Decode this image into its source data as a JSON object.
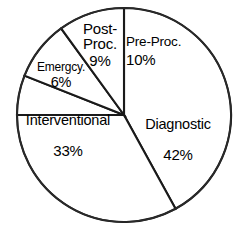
{
  "chart_data": {
    "type": "pie",
    "title": "",
    "subtitle": "",
    "xlabel": "",
    "ylabel": "",
    "legend_position": "none",
    "grid": false,
    "labels_inside_slices": true,
    "start_angle_deg": 0,
    "direction": "clockwise",
    "categories": [
      "Diagnostic",
      "Interventional",
      "Pre-Proc.",
      "Post-Proc.",
      "Emergcy."
    ],
    "values": [
      42,
      33,
      10,
      9,
      6
    ],
    "units": "percent",
    "slices": [
      {
        "name": "Diagnostic",
        "label": "Diagnostic",
        "value": 42,
        "value_label": "42%",
        "start_deg": 0,
        "end_deg": 151.2,
        "color": "#ffffff"
      },
      {
        "name": "Interventional",
        "label": "Interventional",
        "value": 33,
        "value_label": "33%",
        "start_deg": 151.2,
        "end_deg": 270.0,
        "color": "#ffffff"
      },
      {
        "name": "Emergency",
        "label": "Emergcy.",
        "value": 6,
        "value_label": "6%",
        "start_deg": 270.0,
        "end_deg": 291.6,
        "color": "#ffffff"
      },
      {
        "name": "Post-Procedural",
        "label_line1": "Post-",
        "label_line2": "Proc.",
        "label": "Post-Proc.",
        "value": 9,
        "value_label": "9%",
        "start_deg": 291.6,
        "end_deg": 324.0,
        "color": "#ffffff"
      },
      {
        "name": "Pre-Procedural",
        "label": "Pre-Proc.",
        "value": 10,
        "value_label": "10%",
        "start_deg": 324.0,
        "end_deg": 360.0,
        "color": "#ffffff"
      }
    ],
    "geometry": {
      "center_x": 124,
      "center_y": 115,
      "radius": 107
    },
    "style": {
      "slice_fill": "#ffffff",
      "outline_color": "#1a1a1a",
      "background": "#ffffff"
    }
  }
}
